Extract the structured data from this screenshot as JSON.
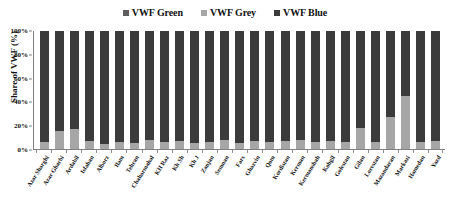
{
  "chart_data": {
    "type": "bar",
    "stacked": true,
    "title": "",
    "xlabel": "",
    "ylabel": "Share of VWF (%)",
    "ylim": [
      0,
      100
    ],
    "ytick_labels": [
      "0%",
      "20%",
      "40%",
      "60%",
      "80%",
      "100%"
    ],
    "ytick_values": [
      0,
      20,
      40,
      60,
      80,
      100
    ],
    "grid": false,
    "legend_position": "top-center",
    "legend": [
      "VWF Green",
      "VWF Grey",
      "VWF Blue"
    ],
    "colors": {
      "VWF Green": "#5e5e5e",
      "VWF Grey": "#a6a6a6",
      "VWF Blue": "#3b3b3b"
    },
    "categories": [
      "Azar Sharghi",
      "Azar Gharbi",
      "Ardabil",
      "Isfahan",
      "Alborz",
      "Ilam",
      "Tehran",
      "Chaharmahal",
      "KH Raz",
      "Kh Sh",
      "Kh J",
      "Zanjan",
      "Semnan",
      "Fars",
      "Ghazvin",
      "Qom",
      "Kordistan",
      "Kerman",
      "Kermanshah",
      "Kohgil",
      "Golestan",
      "Gilan",
      "Lorestan",
      "Mazandaran",
      "Markazi",
      "Hamedan",
      "Yazd"
    ],
    "series": [
      {
        "name": "VWF Green",
        "values": [
          0,
          0,
          0,
          0,
          0,
          0,
          0,
          0,
          0,
          0,
          0,
          0,
          0,
          0,
          0,
          0,
          0,
          0,
          0,
          0,
          0,
          0,
          0,
          0,
          0,
          0,
          0
        ]
      },
      {
        "name": "VWF Grey",
        "values": [
          6,
          15,
          17,
          7,
          4,
          6,
          5,
          8,
          6,
          7,
          5,
          6,
          8,
          5,
          7,
          6,
          7,
          8,
          6,
          7,
          6,
          18,
          6,
          27,
          45,
          6,
          7
        ]
      },
      {
        "name": "VWF Blue",
        "values": [
          94,
          85,
          83,
          93,
          96,
          94,
          95,
          92,
          94,
          93,
          95,
          94,
          92,
          95,
          93,
          94,
          93,
          92,
          94,
          93,
          94,
          82,
          94,
          73,
          55,
          94,
          93
        ]
      }
    ]
  }
}
